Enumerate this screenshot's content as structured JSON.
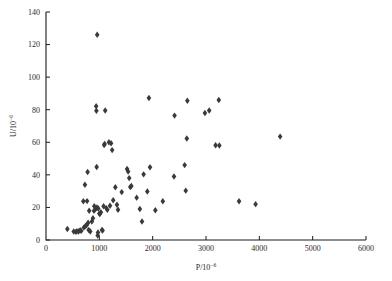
{
  "chart_data": {
    "type": "scatter",
    "title": "",
    "xlabel": "P/10⁻⁶",
    "ylabel": "U/10⁻⁶",
    "xlabel_base": "P/10",
    "xlabel_exp": "−6",
    "ylabel_base": "U/10",
    "ylabel_exp": "−6",
    "xlim": [
      0,
      6000
    ],
    "ylim": [
      0,
      140
    ],
    "xticks": [
      0,
      1000,
      2000,
      3000,
      4000,
      5000,
      6000
    ],
    "yticks": [
      0,
      20,
      40,
      60,
      80,
      100,
      120,
      140
    ],
    "xtick_labels": [
      "0",
      "1000",
      "2000",
      "3000",
      "4000",
      "5000",
      "6000"
    ],
    "ytick_labels": [
      "0",
      "20",
      "40",
      "60",
      "80",
      "100",
      "120",
      "140"
    ],
    "grid": false,
    "legend": false,
    "legend_position": "none",
    "marker_shape": "diamond",
    "marker_color": "#3a3a3c",
    "marker_size": 3.2,
    "series": [
      {
        "name": "samples",
        "points": [
          [
            400,
            6.8
          ],
          [
            520,
            5.2
          ],
          [
            560,
            5.0
          ],
          [
            580,
            5.4
          ],
          [
            610,
            5.2
          ],
          [
            640,
            6.0
          ],
          [
            660,
            5.6
          ],
          [
            700,
            23.8
          ],
          [
            710,
            7.6
          ],
          [
            730,
            33.9
          ],
          [
            740,
            8.6
          ],
          [
            760,
            9.0
          ],
          [
            770,
            23.9
          ],
          [
            780,
            41.8
          ],
          [
            790,
            10.6
          ],
          [
            800,
            6.2
          ],
          [
            810,
            18.0
          ],
          [
            830,
            5.2
          ],
          [
            860,
            11.4
          ],
          [
            880,
            13.4
          ],
          [
            900,
            17.9
          ],
          [
            905,
            20.8
          ],
          [
            930,
            19.0
          ],
          [
            940,
            82.2
          ],
          [
            945,
            79.4
          ],
          [
            950,
            44.8
          ],
          [
            955,
            20.0
          ],
          [
            960,
            126.0
          ],
          [
            970,
            2.8
          ],
          [
            975,
            4.6
          ],
          [
            980,
            19.3
          ],
          [
            1000,
            16.2
          ],
          [
            1010,
            16.0
          ],
          [
            1030,
            17.1
          ],
          [
            1050,
            6.2
          ],
          [
            1060,
            5.8
          ],
          [
            1080,
            20.7
          ],
          [
            1090,
            58.3
          ],
          [
            1100,
            59.0
          ],
          [
            1110,
            79.5
          ],
          [
            1130,
            19.6
          ],
          [
            1150,
            18.5
          ],
          [
            1180,
            60.0
          ],
          [
            1200,
            21.0
          ],
          [
            1220,
            59.4
          ],
          [
            1240,
            55.2
          ],
          [
            1260,
            24.4
          ],
          [
            1300,
            32.4
          ],
          [
            1330,
            21.6
          ],
          [
            1350,
            18.6
          ],
          [
            1420,
            29.4
          ],
          [
            1520,
            43.6
          ],
          [
            1540,
            42.0
          ],
          [
            1560,
            38.0
          ],
          [
            1580,
            32.5
          ],
          [
            1600,
            33.2
          ],
          [
            1700,
            26.0
          ],
          [
            1760,
            19.0
          ],
          [
            1800,
            11.4
          ],
          [
            1830,
            40.3
          ],
          [
            1900,
            29.8
          ],
          [
            1930,
            87.2
          ],
          [
            1950,
            44.7
          ],
          [
            2050,
            18.3
          ],
          [
            2190,
            23.8
          ],
          [
            2400,
            39.0
          ],
          [
            2410,
            76.4
          ],
          [
            2600,
            46.0
          ],
          [
            2620,
            30.3
          ],
          [
            2640,
            62.3
          ],
          [
            2650,
            85.5
          ],
          [
            2980,
            78.0
          ],
          [
            3060,
            79.5
          ],
          [
            3180,
            58.2
          ],
          [
            3240,
            86.0
          ],
          [
            3250,
            58.0
          ],
          [
            3620,
            23.8
          ],
          [
            3930,
            22.0
          ],
          [
            4390,
            63.5
          ]
        ]
      }
    ]
  },
  "plot_geometry": {
    "left": 46,
    "right": 366,
    "top": 12,
    "bottom": 240
  }
}
